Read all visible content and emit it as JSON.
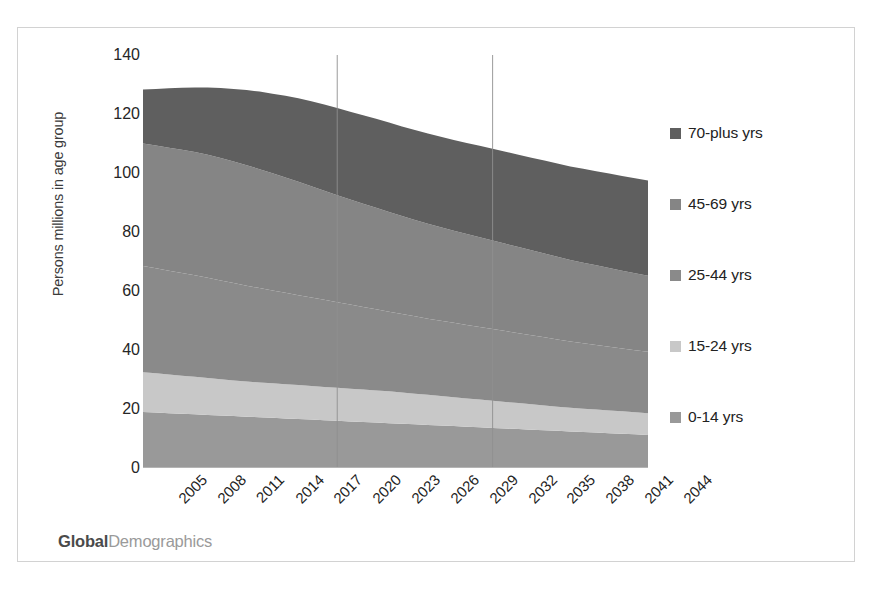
{
  "brand": {
    "part1": "Global",
    "part2": "Demographics"
  },
  "chart_data": {
    "type": "area",
    "stacked": true,
    "title": "",
    "xlabel": "",
    "ylabel": "Persons millions in age group",
    "ylim": [
      0,
      140
    ],
    "ytick_labels": [
      "0",
      "20",
      "40",
      "60",
      "80",
      "100",
      "120",
      "140"
    ],
    "ytick_values": [
      0,
      20,
      40,
      60,
      80,
      100,
      120,
      140
    ],
    "grid": false,
    "legend_position": "right",
    "x": [
      2005,
      2006,
      2007,
      2008,
      2009,
      2010,
      2011,
      2012,
      2013,
      2014,
      2015,
      2016,
      2017,
      2018,
      2019,
      2020,
      2021,
      2022,
      2023,
      2024,
      2025,
      2026,
      2027,
      2028,
      2029,
      2030,
      2031,
      2032,
      2033,
      2034,
      2035,
      2036,
      2037,
      2038,
      2039,
      2040,
      2041,
      2042,
      2043,
      2044
    ],
    "xtick_labels": [
      "2005",
      "2008",
      "2011",
      "2014",
      "2017",
      "2020",
      "2023",
      "2026",
      "2029",
      "2032",
      "2035",
      "2038",
      "2041",
      "2044"
    ],
    "xtick_values": [
      2005,
      2008,
      2011,
      2014,
      2017,
      2020,
      2023,
      2026,
      2029,
      2032,
      2035,
      2038,
      2041,
      2044
    ],
    "series": [
      {
        "name": "0-14 yrs",
        "color": "#999999",
        "values": [
          19.0,
          18.8,
          18.6,
          18.4,
          18.2,
          18.0,
          17.8,
          17.6,
          17.4,
          17.2,
          17.0,
          16.8,
          16.6,
          16.4,
          16.2,
          16.0,
          15.8,
          15.6,
          15.4,
          15.2,
          15.0,
          14.8,
          14.6,
          14.4,
          14.2,
          14.0,
          13.8,
          13.6,
          13.4,
          13.2,
          13.0,
          12.8,
          12.6,
          12.4,
          12.2,
          12.0,
          11.8,
          11.6,
          11.4,
          11.2
        ]
      },
      {
        "name": "15-24 yrs",
        "color": "#c8c8c8",
        "values": [
          13.5,
          13.3,
          13.1,
          12.9,
          12.7,
          12.5,
          12.3,
          12.1,
          11.9,
          11.8,
          11.7,
          11.6,
          11.5,
          11.4,
          11.3,
          11.2,
          11.1,
          11.0,
          10.9,
          10.8,
          10.6,
          10.4,
          10.2,
          10.0,
          9.8,
          9.6,
          9.4,
          9.2,
          9.0,
          8.8,
          8.6,
          8.4,
          8.2,
          8.0,
          7.9,
          7.8,
          7.7,
          7.6,
          7.5,
          7.4
        ]
      },
      {
        "name": "25-44 yrs",
        "color": "#8a8a8a",
        "values": [
          36.0,
          35.6,
          35.2,
          34.8,
          34.4,
          34.0,
          33.5,
          33.0,
          32.5,
          32.0,
          31.5,
          31.0,
          30.5,
          30.0,
          29.5,
          29.0,
          28.5,
          28.0,
          27.5,
          27.0,
          26.6,
          26.2,
          25.8,
          25.5,
          25.2,
          24.9,
          24.6,
          24.3,
          24.0,
          23.7,
          23.4,
          23.1,
          22.8,
          22.5,
          22.2,
          21.9,
          21.6,
          21.3,
          21.0,
          20.8
        ]
      },
      {
        "name": "45-69 yrs",
        "color": "#858585",
        "values": [
          41.5,
          41.6,
          41.7,
          41.8,
          41.8,
          41.7,
          41.5,
          41.2,
          40.8,
          40.3,
          39.7,
          39.1,
          38.4,
          37.7,
          37.0,
          36.3,
          35.6,
          35.0,
          34.4,
          33.8,
          33.2,
          32.7,
          32.2,
          31.7,
          31.2,
          30.8,
          30.4,
          30.0,
          29.6,
          29.2,
          28.8,
          28.4,
          28.0,
          27.6,
          27.3,
          27.0,
          26.7,
          26.4,
          26.1,
          25.8
        ]
      },
      {
        "name": "70-plus yrs",
        "color": "#5f5f5f",
        "values": [
          18.3,
          19.2,
          20.1,
          21.0,
          21.9,
          22.8,
          23.7,
          24.6,
          25.5,
          26.3,
          27.0,
          27.7,
          28.3,
          28.8,
          29.2,
          29.5,
          29.8,
          30.0,
          30.2,
          30.3,
          30.4,
          30.5,
          30.6,
          30.7,
          30.8,
          30.9,
          31.0,
          31.1,
          31.2,
          31.3,
          31.4,
          31.5,
          31.6,
          31.7,
          31.8,
          31.9,
          32.0,
          32.1,
          32.2,
          32.3
        ]
      }
    ],
    "annotation_gridlines": [
      2020,
      2032
    ],
    "totals_note": ""
  }
}
